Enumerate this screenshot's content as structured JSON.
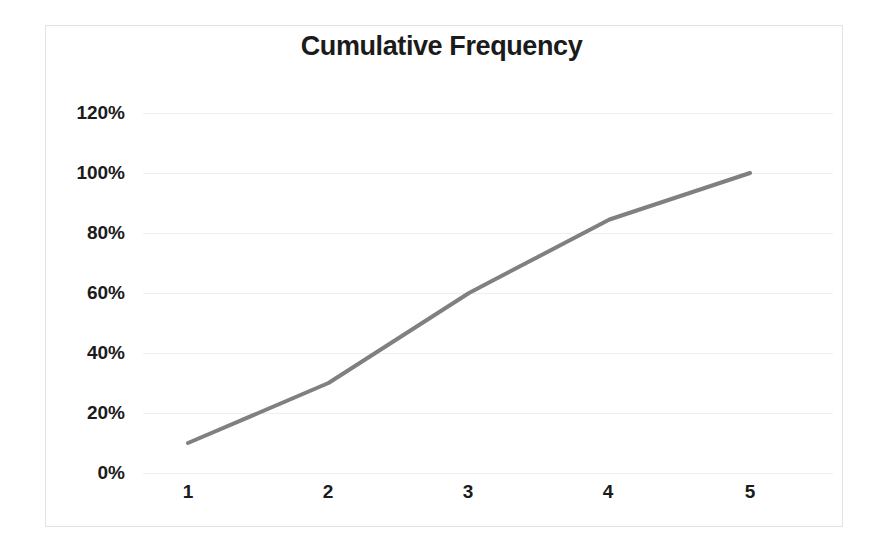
{
  "chart_data": {
    "type": "line",
    "title": "Cumulative Frequency",
    "xlabel": "",
    "ylabel": "",
    "categories": [
      "1",
      "2",
      "3",
      "4",
      "5"
    ],
    "x": [
      1,
      2,
      3,
      4,
      5
    ],
    "values": [
      0.1,
      0.3,
      0.6,
      0.845,
      1.0
    ],
    "value_labels": [
      "10%",
      "30%",
      "60%",
      "85%",
      "100%"
    ],
    "ylim": [
      0,
      1.2
    ],
    "ytick_values": [
      0,
      0.2,
      0.4,
      0.6,
      0.8,
      1.0,
      1.2
    ],
    "ytick_labels": [
      "0%",
      "20%",
      "40%",
      "60%",
      "80%",
      "100%",
      "120%"
    ],
    "xtick_labels": [
      "1",
      "2",
      "3",
      "4",
      "5"
    ],
    "grid": true,
    "grid_axis": "y",
    "legend": false,
    "legend_position": "none",
    "series": [
      {
        "name": "Cumulative Frequency",
        "values": [
          0.1,
          0.3,
          0.6,
          0.845,
          1.0
        ],
        "color": "#808080",
        "line_width": 4,
        "markers": false
      }
    ],
    "colors": {
      "line": "#808080",
      "grid": "#efefef",
      "border": "#e2e2e2",
      "text": "#1b1b1b",
      "background": "#ffffff"
    }
  }
}
